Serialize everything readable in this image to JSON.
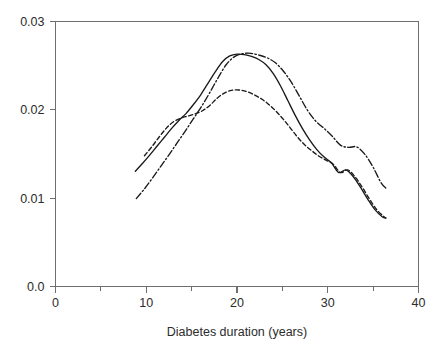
{
  "chart_data": {
    "type": "line",
    "title": "",
    "xlabel": "Diabetes duration (years)",
    "ylabel": "",
    "xlim": [
      0,
      40
    ],
    "ylim": [
      0.0,
      0.03
    ],
    "grid": false,
    "legend": "none",
    "x_ticks": [
      0,
      10,
      20,
      30,
      40
    ],
    "x_tick_labels": [
      "0",
      "10",
      "20",
      "30",
      "40"
    ],
    "x_minor_ticks": [
      5,
      15,
      25,
      35
    ],
    "y_ticks": [
      0.0,
      0.01,
      0.02,
      0.03
    ],
    "y_tick_labels": [
      "0.0",
      "0.01",
      "0.02",
      "0.03"
    ],
    "series": [
      {
        "name": "solid",
        "style": "solid",
        "dasharray": "none",
        "color": "#1a1a1a",
        "x": [
          8.8,
          9.6,
          10.4,
          11.2,
          12.0,
          12.8,
          13.6,
          14.4,
          15.2,
          16.0,
          16.8,
          17.6,
          18.4,
          19.2,
          20.0,
          20.8,
          21.6,
          22.4,
          23.2,
          24.0,
          24.8,
          25.6,
          26.4,
          27.2,
          28.0,
          28.8,
          29.6,
          30.4,
          31.2,
          32.0,
          32.8,
          33.6,
          34.4,
          35.2,
          36.0,
          36.4
        ],
        "y": [
          0.01305,
          0.01395,
          0.0149,
          0.0159,
          0.0169,
          0.0179,
          0.0188,
          0.0196,
          0.0206,
          0.0217,
          0.023,
          0.0243,
          0.02545,
          0.0261,
          0.0263,
          0.02625,
          0.02605,
          0.0257,
          0.0251,
          0.0241,
          0.0227,
          0.02105,
          0.0194,
          0.0179,
          0.0166,
          0.0155,
          0.01465,
          0.014,
          0.0129,
          0.0132,
          0.01245,
          0.01125,
          0.0099,
          0.0087,
          0.0079,
          0.00775
        ]
      },
      {
        "name": "dashed",
        "style": "dashed",
        "dasharray": "4.2,2.6",
        "color": "#1a1a1a",
        "x": [
          9.8,
          10.6,
          11.4,
          12.2,
          13.0,
          13.8,
          14.6,
          15.4,
          16.2,
          17.0,
          17.8,
          18.6,
          19.4,
          20.2,
          21.0,
          21.8,
          22.6,
          23.4,
          24.2,
          25.0,
          25.8,
          26.6,
          27.4,
          28.2,
          29.0,
          29.8,
          30.6,
          31.4,
          32.2,
          33.0,
          33.8,
          34.6,
          35.4,
          36.2,
          36.4
        ],
        "y": [
          0.0148,
          0.0158,
          0.0169,
          0.0179,
          0.01865,
          0.01905,
          0.0193,
          0.01955,
          0.0199,
          0.0205,
          0.0213,
          0.0219,
          0.0222,
          0.02225,
          0.0221,
          0.02175,
          0.0213,
          0.0207,
          0.01995,
          0.01905,
          0.01805,
          0.017,
          0.0161,
          0.0154,
          0.01478,
          0.0143,
          0.01385,
          0.0129,
          0.0132,
          0.01243,
          0.01124,
          0.0099,
          0.0087,
          0.0079,
          0.00775
        ]
      },
      {
        "name": "dash-dot",
        "style": "dash-dot",
        "dasharray": "7,2.4,1.4,2.4",
        "color": "#1a1a1a",
        "x": [
          8.9,
          9.8,
          10.7,
          11.6,
          12.5,
          13.4,
          14.3,
          15.2,
          16.1,
          17.0,
          17.9,
          18.8,
          19.7,
          20.6,
          21.5,
          22.4,
          23.3,
          24.2,
          25.1,
          26.0,
          26.9,
          27.8,
          28.7,
          29.6,
          30.5,
          31.4,
          32.3,
          33.2,
          34.1,
          35.0,
          35.9,
          36.5
        ],
        "y": [
          0.00995,
          0.01105,
          0.0123,
          0.0136,
          0.0149,
          0.01625,
          0.0176,
          0.019,
          0.0204,
          0.02195,
          0.0236,
          0.0251,
          0.026,
          0.02635,
          0.0264,
          0.0262,
          0.0259,
          0.02535,
          0.0244,
          0.0231,
          0.0215,
          0.0199,
          0.0187,
          0.0179,
          0.017,
          0.016,
          0.01575,
          0.0158,
          0.01495,
          0.0135,
          0.0117,
          0.01105
        ]
      }
    ]
  }
}
